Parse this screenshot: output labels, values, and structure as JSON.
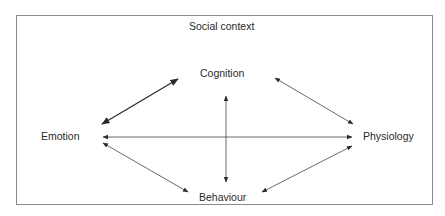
{
  "diagram": {
    "frame_label": "Social context",
    "nodes": {
      "cognition": "Cognition",
      "emotion": "Emotion",
      "physiology": "Physiology",
      "behaviour": "Behaviour"
    },
    "edges": [
      {
        "from": "Cognition",
        "to": "Emotion",
        "type": "bidirectional"
      },
      {
        "from": "Cognition",
        "to": "Physiology",
        "type": "bidirectional"
      },
      {
        "from": "Cognition",
        "to": "Behaviour",
        "type": "bidirectional"
      },
      {
        "from": "Emotion",
        "to": "Physiology",
        "type": "bidirectional"
      },
      {
        "from": "Emotion",
        "to": "Behaviour",
        "type": "bidirectional"
      },
      {
        "from": "Behaviour",
        "to": "Physiology",
        "type": "bidirectional"
      }
    ],
    "colors": {
      "stroke": "#2a2a2a",
      "frame": "#8a8a8a"
    }
  }
}
